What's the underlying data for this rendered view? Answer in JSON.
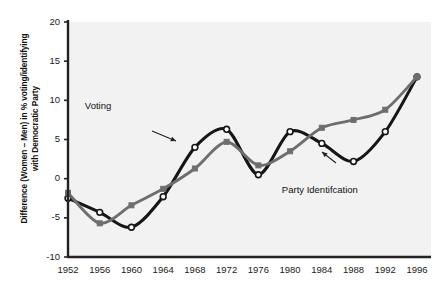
{
  "chart_data": {
    "type": "line",
    "title": "",
    "xlabel": "",
    "ylabel": "Difference (Women – Men) in % voting/identifying\nwith Democratic Party",
    "x": [
      1952,
      1956,
      1960,
      1964,
      1968,
      1972,
      1976,
      1980,
      1984,
      1988,
      1992,
      1996
    ],
    "xtick_labels": [
      "1952",
      "1956",
      "1960",
      "1964",
      "1968",
      "1972",
      "1976",
      "1980",
      "1984",
      "1988",
      "1992",
      "1996"
    ],
    "ytick_labels": [
      "20",
      "15",
      "10",
      "5",
      "0",
      "-5",
      "-10"
    ],
    "ytick_values": [
      20,
      15,
      10,
      5,
      0,
      -5,
      -10
    ],
    "xlim": [
      1950,
      1998
    ],
    "ylim": [
      -10,
      20
    ],
    "grid": false,
    "legend_position": "inline-annotations",
    "series": [
      {
        "name": "Voting",
        "color": "#161616",
        "marker": "open-circle",
        "values": [
          -2.5,
          -4.3,
          -6.2,
          -2.3,
          4.0,
          6.3,
          0.5,
          6.0,
          4.5,
          2.2,
          6.0,
          13.0
        ]
      },
      {
        "name": "Party Identifcation",
        "color": "#6e6e6e",
        "marker": "filled-square",
        "values": [
          -1.8,
          -5.7,
          -3.4,
          -1.3,
          1.3,
          4.7,
          1.7,
          3.5,
          6.5,
          7.5,
          8.8,
          13.0
        ]
      }
    ],
    "annotations": [
      {
        "text": "Voting",
        "x": 1959.8,
        "y": 9.1
      },
      {
        "text": "Party Identifcation",
        "x": 1983.5,
        "y": -1.6
      }
    ]
  },
  "axes": {
    "plot_background": "#f2f2f2",
    "axis_color": "#222222"
  }
}
